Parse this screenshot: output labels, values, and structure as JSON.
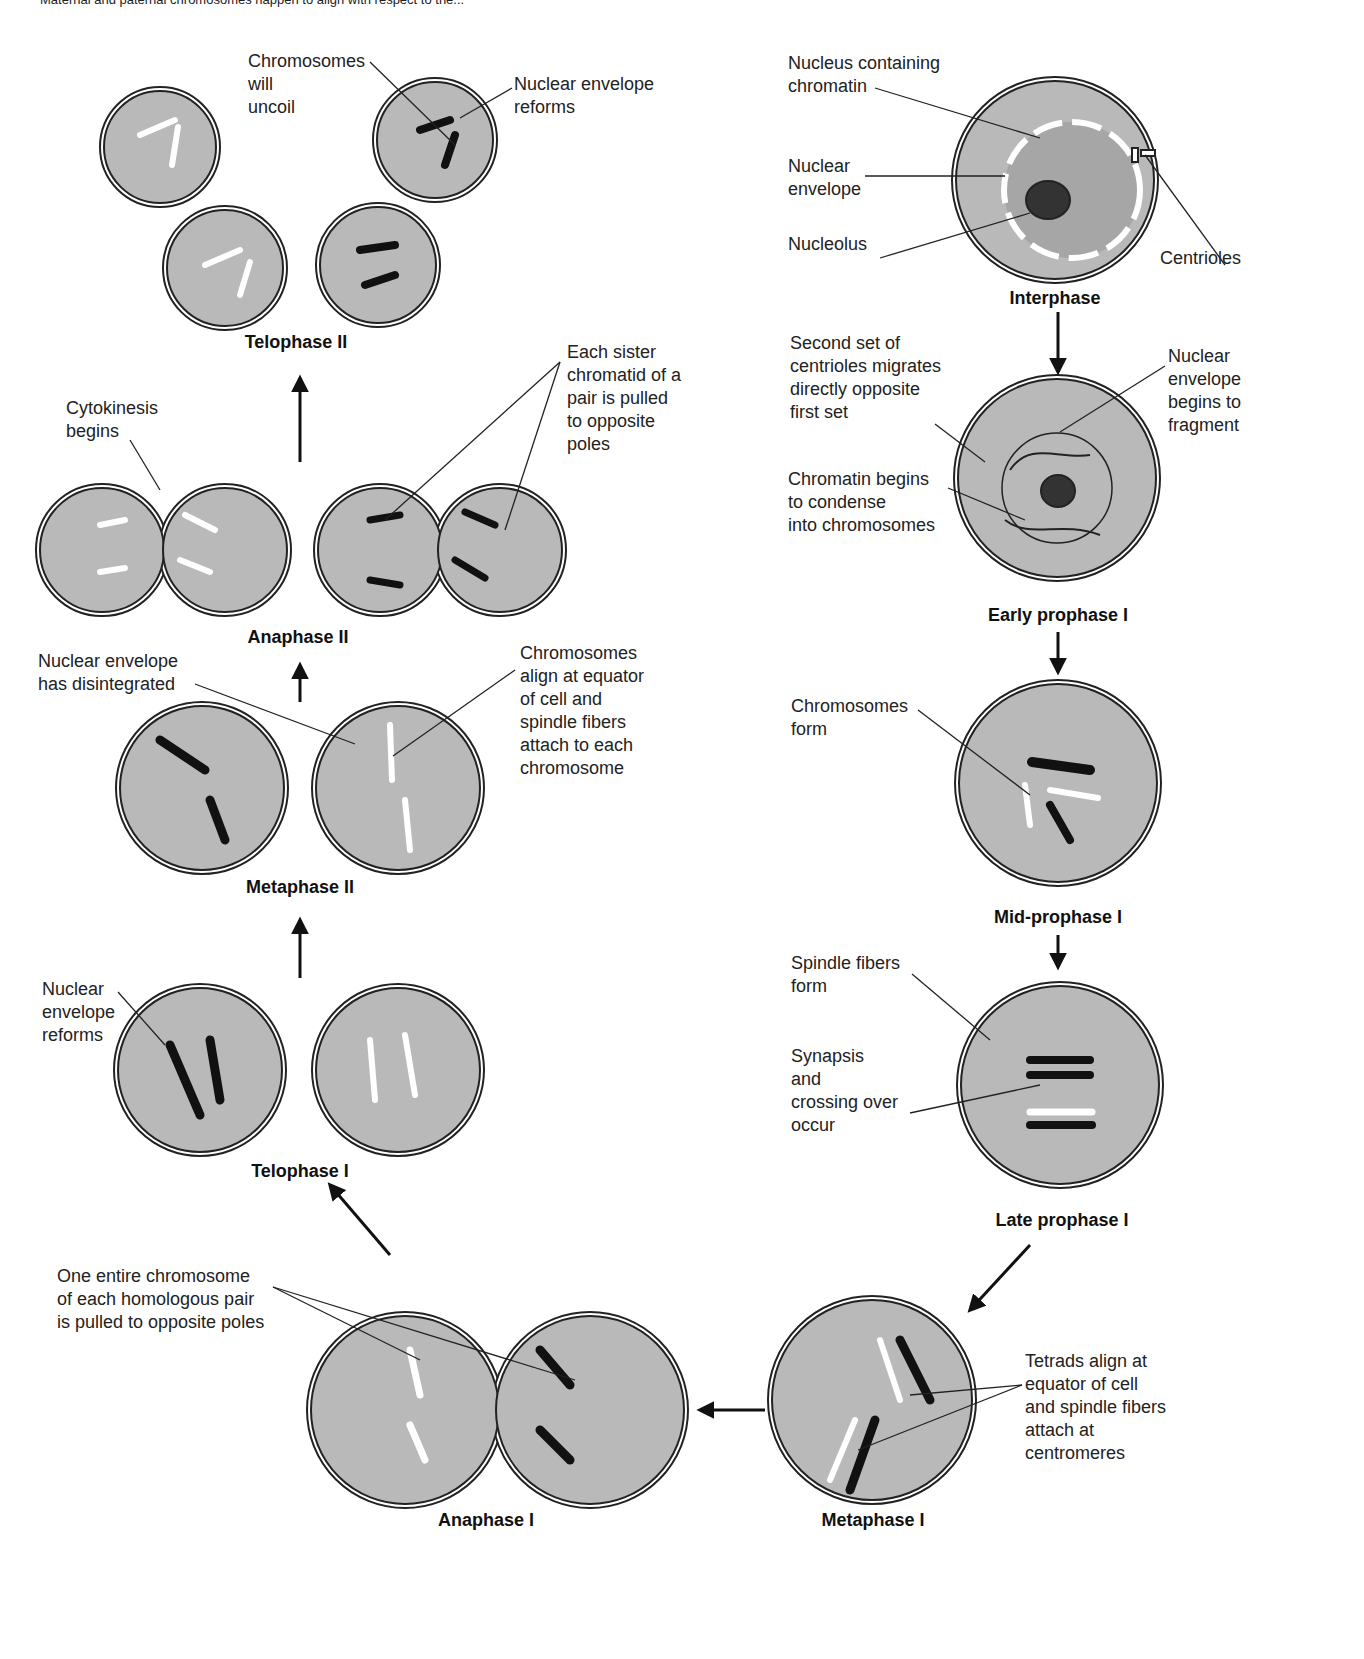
{
  "caption_fragment": "Maternal and paternal chromosomes happen to align with respect to the...",
  "colors": {
    "cell_fill": "#b9b9b9",
    "outline": "#222222",
    "background": "#ffffff"
  },
  "phases": {
    "interphase": "Interphase",
    "early_prophase_1": "Early prophase I",
    "mid_prophase_1": "Mid-prophase I",
    "late_prophase_1": "Late prophase I",
    "metaphase_1": "Metaphase I",
    "anaphase_1": "Anaphase I",
    "telophase_1": "Telophase I",
    "metaphase_2": "Metaphase II",
    "anaphase_2": "Anaphase II",
    "telophase_2": "Telophase II"
  },
  "labels": {
    "nucleus_chromatin": "Nucleus containing\nchromatin",
    "nuclear_envelope": "Nuclear\nenvelope",
    "nucleolus": "Nucleolus",
    "centrioles": "Centrioles",
    "second_set_centrioles": "Second set of\ncentrioles migrates\ndirectly opposite\nfirst set",
    "nuclear_envelope_fragment": "Nuclear\nenvelope\nbegins to\nfragment",
    "chromatin_condense": "Chromatin begins\nto condense\ninto chromosomes",
    "chromosomes_form": "Chromosomes\nform",
    "spindle_fibers_form": "Spindle fibers\nform",
    "synapsis": "Synapsis\nand\ncrossing over\noccur",
    "tetrads_align": "Tetrads align at\nequator of cell\nand spindle fibers\nattach at\ncentromeres",
    "entire_chromosome": "One entire chromosome\nof each homologous pair\nis pulled to opposite poles",
    "nuclear_envelope_reforms_t1": "Nuclear\nenvelope\nreforms",
    "nuclear_envelope_disintegrated": "Nuclear envelope\nhas disintegrated",
    "chromosomes_align": "Chromosomes\nalign at equator\nof cell and\nspindle fibers\nattach to each\nchromosome",
    "cytokinesis": "Cytokinesis\nbegins",
    "sister_chromatid": "Each sister\nchromatid of a\npair is pulled\nto opposite\npoles",
    "chromosomes_uncoil": "Chromosomes\nwill\nuncoil",
    "nuclear_envelope_reforms_t2": "Nuclear envelope\nreforms"
  }
}
